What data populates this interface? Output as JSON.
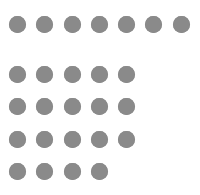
{
  "figure": {
    "background": "#ffffff",
    "dot_color": "#8a8a8a",
    "dot_diameter": 17,
    "total_dots": 26,
    "rows": [
      {
        "count": 7,
        "y": 24,
        "x": [
          17,
          44,
          72,
          99,
          126,
          153,
          181
        ]
      },
      {
        "count": 5,
        "y": 74,
        "x": [
          17,
          44,
          72,
          99,
          126
        ]
      },
      {
        "count": 5,
        "y": 106,
        "x": [
          17,
          44,
          72,
          99,
          126
        ]
      },
      {
        "count": 5,
        "y": 139,
        "x": [
          17,
          44,
          72,
          99,
          126
        ]
      },
      {
        "count": 4,
        "y": 171,
        "x": [
          17,
          44,
          72,
          99
        ]
      }
    ]
  }
}
